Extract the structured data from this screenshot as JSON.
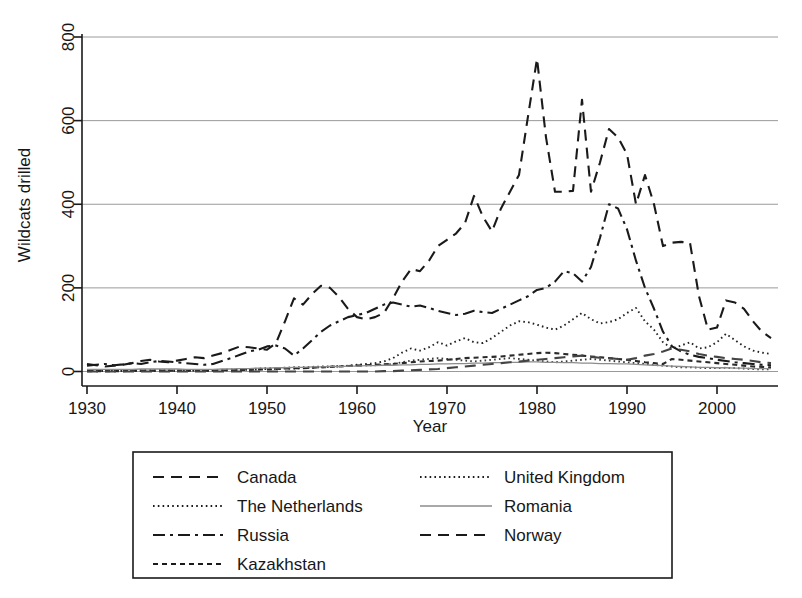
{
  "chart_data": {
    "type": "line",
    "title": "",
    "xlabel": "Year",
    "ylabel": "Wildcats drilled",
    "xlim": [
      1930,
      2006
    ],
    "ylim": [
      0,
      800
    ],
    "xticks": [
      1930,
      1940,
      1950,
      1960,
      1970,
      1980,
      1990,
      2000
    ],
    "yticks": [
      0,
      200,
      400,
      600,
      800
    ],
    "xtick_labels": [
      "1930",
      "1940",
      "1950",
      "1960",
      "1970",
      "1980",
      "1990",
      "2000"
    ],
    "ytick_labels": [
      "0",
      "200",
      "400",
      "600",
      "800"
    ],
    "grid": "horizontal",
    "legend_position": "below-plot",
    "x": [
      1930,
      1931,
      1932,
      1933,
      1934,
      1935,
      1936,
      1937,
      1938,
      1939,
      1940,
      1941,
      1942,
      1943,
      1944,
      1945,
      1946,
      1947,
      1948,
      1949,
      1950,
      1951,
      1952,
      1953,
      1954,
      1955,
      1956,
      1957,
      1958,
      1959,
      1960,
      1961,
      1962,
      1963,
      1964,
      1965,
      1966,
      1967,
      1968,
      1969,
      1970,
      1971,
      1972,
      1973,
      1974,
      1975,
      1976,
      1977,
      1978,
      1979,
      1980,
      1981,
      1982,
      1983,
      1984,
      1985,
      1986,
      1987,
      1988,
      1989,
      1990,
      1991,
      1992,
      1993,
      1994,
      1995,
      1996,
      1997,
      1998,
      1999,
      2000,
      2001,
      2002,
      2003,
      2004,
      2005,
      2006
    ],
    "series": [
      {
        "name": "Canada",
        "line_style": "long-dash",
        "color": "#1a1a1a",
        "values": [
          18,
          15,
          12,
          14,
          16,
          20,
          25,
          28,
          24,
          22,
          26,
          30,
          34,
          32,
          38,
          44,
          52,
          60,
          58,
          55,
          52,
          68,
          120,
          175,
          160,
          185,
          205,
          200,
          178,
          150,
          130,
          125,
          130,
          140,
          175,
          215,
          245,
          240,
          265,
          300,
          315,
          330,
          355,
          420,
          370,
          335,
          390,
          430,
          470,
          610,
          748,
          560,
          430,
          430,
          432,
          650,
          430,
          500,
          580,
          560,
          520,
          400,
          470,
          400,
          300,
          308,
          310,
          308,
          180,
          100,
          105,
          170,
          165,
          150,
          120,
          95,
          80
        ]
      },
      {
        "name": "The Netherlands",
        "line_style": "dotted",
        "color": "#3a3a3a",
        "values": [
          2,
          2,
          2,
          3,
          3,
          3,
          4,
          4,
          4,
          3,
          3,
          2,
          2,
          2,
          3,
          4,
          5,
          6,
          6,
          7,
          8,
          8,
          9,
          10,
          10,
          11,
          12,
          12,
          13,
          13,
          14,
          15,
          15,
          16,
          18,
          22,
          26,
          28,
          30,
          32,
          30,
          28,
          26,
          24,
          26,
          28,
          30,
          32,
          30,
          28,
          26,
          24,
          22,
          24,
          26,
          28,
          30,
          28,
          26,
          24,
          22,
          20,
          18,
          16,
          14,
          12,
          10,
          10,
          9,
          8,
          8,
          9,
          8,
          7,
          6,
          5,
          5
        ]
      },
      {
        "name": "Russia",
        "line_style": "dash-dot",
        "color": "#1a1a1a",
        "values": [
          14,
          16,
          18,
          15,
          17,
          20,
          18,
          22,
          25,
          24,
          22,
          20,
          18,
          16,
          18,
          25,
          32,
          40,
          48,
          52,
          60,
          62,
          55,
          38,
          55,
          75,
          95,
          110,
          120,
          130,
          135,
          140,
          150,
          160,
          165,
          160,
          155,
          158,
          152,
          145,
          140,
          135,
          138,
          145,
          142,
          140,
          150,
          160,
          170,
          180,
          195,
          200,
          215,
          240,
          235,
          215,
          250,
          320,
          400,
          390,
          340,
          265,
          200,
          150,
          95,
          60,
          48,
          40,
          35,
          32,
          28,
          25,
          22,
          20,
          18,
          16,
          15
        ]
      },
      {
        "name": "Kazakhstan",
        "line_style": "short-dash",
        "color": "#2a2a2a",
        "values": [
          1,
          1,
          1,
          1,
          1,
          2,
          2,
          2,
          2,
          2,
          2,
          2,
          2,
          2,
          2,
          3,
          3,
          4,
          4,
          5,
          5,
          6,
          7,
          8,
          8,
          9,
          10,
          11,
          12,
          13,
          14,
          15,
          16,
          17,
          18,
          20,
          22,
          24,
          25,
          26,
          28,
          30,
          32,
          33,
          34,
          35,
          36,
          38,
          40,
          42,
          44,
          45,
          44,
          42,
          40,
          38,
          36,
          34,
          32,
          30,
          28,
          25,
          22,
          20,
          18,
          30,
          28,
          26,
          24,
          22,
          20,
          18,
          16,
          14,
          12,
          11,
          10
        ]
      },
      {
        "name": "United Kingdom",
        "line_style": "dotted",
        "color": "#222222",
        "values": [
          1,
          1,
          1,
          1,
          1,
          1,
          1,
          1,
          1,
          1,
          1,
          2,
          2,
          2,
          2,
          3,
          3,
          4,
          4,
          5,
          6,
          6,
          7,
          7,
          8,
          9,
          10,
          11,
          12,
          14,
          16,
          18,
          20,
          24,
          32,
          45,
          55,
          50,
          58,
          70,
          62,
          72,
          80,
          70,
          68,
          80,
          95,
          110,
          120,
          118,
          112,
          105,
          100,
          110,
          125,
          140,
          125,
          115,
          118,
          125,
          140,
          152,
          120,
          100,
          70,
          55,
          62,
          70,
          55,
          58,
          70,
          90,
          75,
          60,
          50,
          45,
          42
        ]
      },
      {
        "name": "Romania",
        "line_style": "solid",
        "color": "#8c8c8c",
        "values": [
          5,
          5,
          5,
          5,
          5,
          5,
          6,
          6,
          6,
          6,
          6,
          5,
          5,
          5,
          5,
          6,
          6,
          7,
          7,
          8,
          8,
          9,
          9,
          10,
          10,
          11,
          11,
          12,
          12,
          13,
          13,
          14,
          14,
          15,
          15,
          16,
          16,
          17,
          17,
          18,
          18,
          19,
          19,
          20,
          20,
          21,
          21,
          22,
          22,
          23,
          23,
          22,
          22,
          21,
          21,
          20,
          20,
          19,
          19,
          18,
          18,
          17,
          16,
          15,
          14,
          13,
          12,
          11,
          10,
          10,
          9,
          9,
          8,
          8,
          7,
          7,
          7
        ]
      },
      {
        "name": "Norway",
        "line_style": "long-dash",
        "color": "#444444",
        "values": [
          0,
          0,
          0,
          0,
          0,
          0,
          0,
          0,
          0,
          0,
          0,
          0,
          0,
          0,
          0,
          0,
          0,
          0,
          0,
          0,
          0,
          0,
          0,
          0,
          0,
          0,
          0,
          0,
          0,
          0,
          0,
          0,
          0,
          1,
          1,
          2,
          3,
          4,
          5,
          6,
          8,
          10,
          12,
          14,
          16,
          18,
          20,
          22,
          24,
          26,
          28,
          30,
          32,
          34,
          36,
          38,
          35,
          33,
          32,
          30,
          28,
          32,
          38,
          42,
          48,
          55,
          52,
          48,
          42,
          38,
          35,
          32,
          30,
          28,
          25,
          22,
          20
        ]
      }
    ]
  },
  "legend": {
    "col1": [
      {
        "label": "Canada",
        "style": "long-dash"
      },
      {
        "label": "The Netherlands",
        "style": "dotted"
      },
      {
        "label": "Russia",
        "style": "dash-dot"
      },
      {
        "label": "Kazakhstan",
        "style": "short-dash"
      }
    ],
    "col2": [
      {
        "label": "United Kingdom",
        "style": "dotted"
      },
      {
        "label": "Romania",
        "style": "solid"
      },
      {
        "label": "Norway",
        "style": "long-dash"
      }
    ]
  },
  "colors": {
    "axis": "#1a1a1a",
    "grid": "#9a9a9a",
    "background": "#ffffff",
    "romania": "#8c8c8c"
  }
}
